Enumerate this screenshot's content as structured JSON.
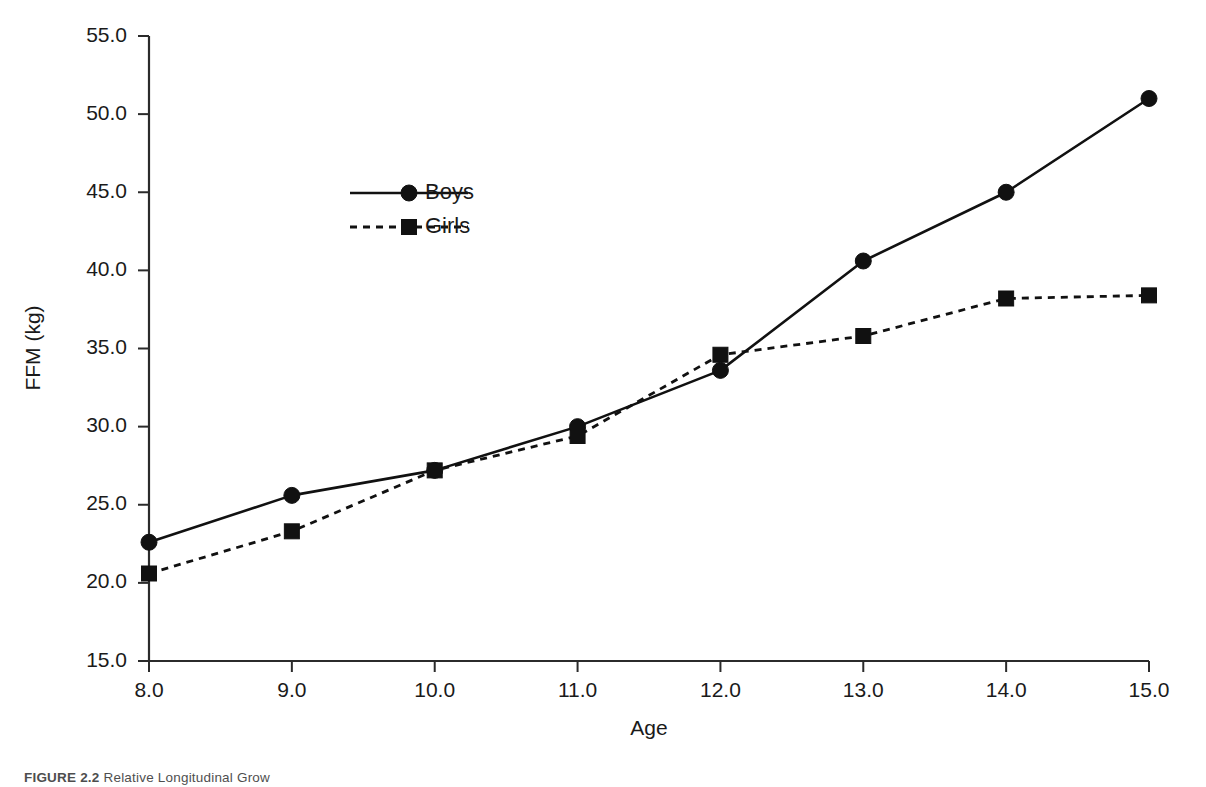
{
  "chart_data": {
    "type": "line",
    "title": "",
    "xlabel": "Age",
    "ylabel": "FFM (kg)",
    "x": [
      8.0,
      9.0,
      10.0,
      11.0,
      12.0,
      13.0,
      14.0,
      15.0
    ],
    "xtick_labels": [
      "8.0",
      "9.0",
      "10.0",
      "11.0",
      "12.0",
      "13.0",
      "14.0",
      "15.0"
    ],
    "ytick_labels": [
      "15.0",
      "20.0",
      "25.0",
      "30.0",
      "35.0",
      "40.0",
      "45.0",
      "50.0",
      "55.0"
    ],
    "ytick_values": [
      15.0,
      20.0,
      25.0,
      30.0,
      35.0,
      40.0,
      45.0,
      50.0,
      55.0
    ],
    "xlim": [
      8.0,
      15.0
    ],
    "ylim": [
      15.0,
      55.0
    ],
    "grid": false,
    "legend_position": "upper-left-inside",
    "series": [
      {
        "name": "Boys",
        "marker": "circle",
        "linestyle": "solid",
        "color": "#111111",
        "values": [
          22.6,
          25.6,
          27.2,
          30.0,
          33.6,
          40.6,
          45.0,
          51.0
        ]
      },
      {
        "name": "Girls",
        "marker": "square",
        "linestyle": "dashed",
        "color": "#111111",
        "values": [
          20.6,
          23.3,
          27.2,
          29.4,
          34.6,
          35.8,
          38.2,
          38.4
        ]
      }
    ]
  },
  "legend": {
    "entries": [
      "Boys",
      "Girls"
    ]
  },
  "caption": {
    "figure_number": "FIGURE 2.2",
    "text": "Relative Longitudinal Grow"
  }
}
